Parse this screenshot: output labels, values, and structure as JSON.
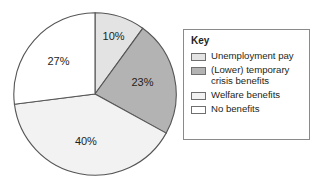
{
  "chart_data": {
    "type": "pie",
    "title": "",
    "legend_position": "right",
    "categories": [
      "Unemployment pay",
      "(Lower) temporary crisis benefits",
      "Welfare benefits",
      "No benefits"
    ],
    "values": [
      10,
      23,
      40,
      27
    ],
    "value_labels": [
      "10%",
      "23%",
      "40%",
      "27%"
    ],
    "unit": "%",
    "colors": [
      "#e3e3e3",
      "#b3b3b3",
      "#f2f2f2",
      "#ffffff"
    ],
    "slice_order_from_12_oclock_clockwise": [
      "Unemployment pay",
      "(Lower) temporary crisis benefits",
      "Welfare benefits",
      "No benefits"
    ],
    "slices": [
      {
        "label": "Unemployment pay",
        "value": 10,
        "value_label": "10%",
        "color": "#e3e3e3",
        "start_angle": 0,
        "end_angle": 36
      },
      {
        "label": "(Lower) temporary crisis benefits",
        "value": 23,
        "value_label": "23%",
        "color": "#b3b3b3",
        "start_angle": 36,
        "end_angle": 118.8
      },
      {
        "label": "Welfare benefits",
        "value": 40,
        "value_label": "40%",
        "color": "#f2f2f2",
        "start_angle": 118.8,
        "end_angle": 262.8
      },
      {
        "label": "No benefits",
        "value": 27,
        "value_label": "27%",
        "color": "#ffffff",
        "start_angle": 262.8,
        "end_angle": 360
      }
    ]
  },
  "legend": {
    "title": "Key",
    "items": [
      {
        "label": "Unemployment pay",
        "color": "#e3e3e3"
      },
      {
        "label": "(Lower) temporary\ncrisis benefits",
        "color": "#b3b3b3"
      },
      {
        "label": "Welfare benefits",
        "color": "#f2f2f2"
      },
      {
        "label": "No benefits",
        "color": "#ffffff"
      }
    ]
  },
  "style": {
    "slice_outline": "#555555",
    "legend_border": "#8a8a8a",
    "text_color": "#231f20",
    "background": "#ffffff"
  }
}
